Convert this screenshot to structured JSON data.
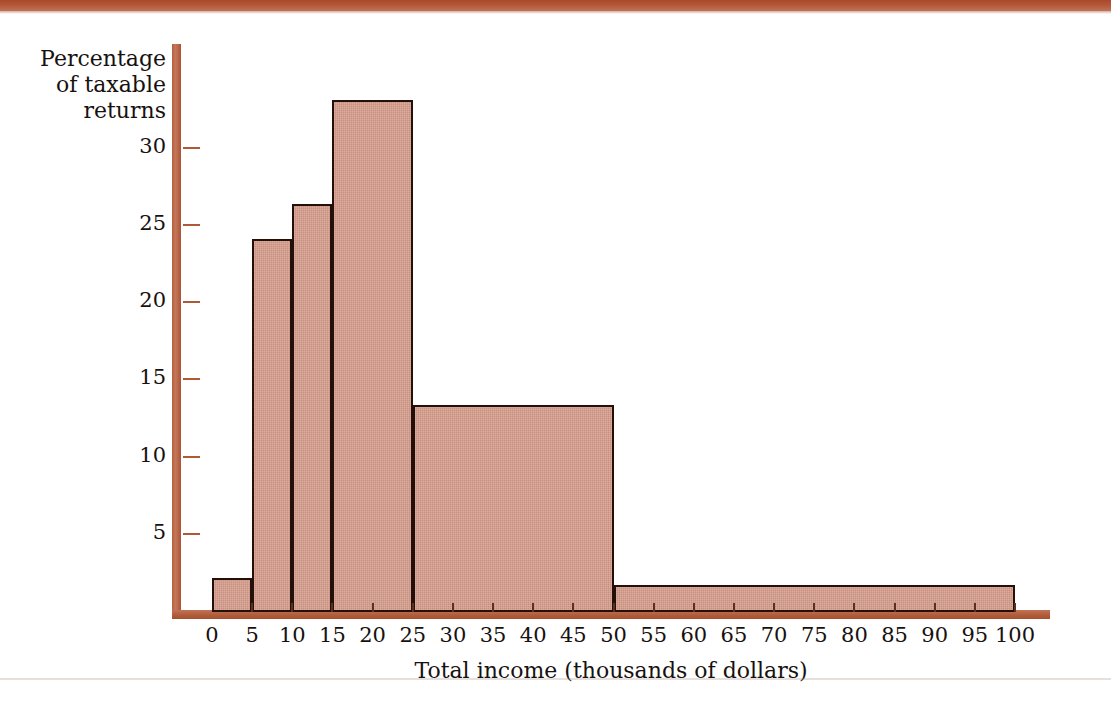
{
  "page": {
    "background_color": "#ffffff",
    "rule_color": "#b2573 8",
    "top_rule_color": "#b25738",
    "bottom_rule_color": "#b0968c"
  },
  "chart_data": {
    "type": "bar",
    "subtype": "histogram",
    "title": "",
    "xlabel": "Total income (thousands of dollars)",
    "ylabel": "Percentage\nof taxable\nreturns",
    "ylabel_lines": [
      "Percentage",
      "of taxable",
      "returns"
    ],
    "xlim": [
      0,
      105
    ],
    "ylim": [
      0,
      34
    ],
    "grid": false,
    "legend": null,
    "axis_color": "#b5603f",
    "bar_fill_color": "#cf9583",
    "bar_edge_color": "#241008",
    "text_color": "#17110f",
    "x_ticks": [
      0,
      5,
      10,
      15,
      20,
      25,
      30,
      35,
      40,
      45,
      50,
      55,
      60,
      65,
      70,
      75,
      80,
      85,
      90,
      95,
      100
    ],
    "x_tick_labels": [
      "0",
      "5",
      "10",
      "15",
      "20",
      "25",
      "30",
      "35",
      "40",
      "45",
      "50",
      "55",
      "60",
      "65",
      "70",
      "75",
      "80",
      "85",
      "90",
      "95",
      "100"
    ],
    "y_ticks": [
      5,
      10,
      15,
      20,
      25,
      30
    ],
    "y_tick_labels": [
      "5",
      "10",
      "15",
      "20",
      "25",
      "30"
    ],
    "bins": [
      {
        "label": "0–5",
        "x0": 0,
        "x1": 5,
        "value": 2.1
      },
      {
        "label": "5–10",
        "x0": 5,
        "x1": 10,
        "value": 24.0
      },
      {
        "label": "10–15",
        "x0": 10,
        "x1": 15,
        "value": 26.3
      },
      {
        "label": "15–25",
        "x0": 15,
        "x1": 25,
        "value": 33.0
      },
      {
        "label": "25–50",
        "x0": 25,
        "x1": 50,
        "value": 13.3
      },
      {
        "label": "50–100",
        "x0": 50,
        "x1": 100,
        "value": 1.6
      }
    ]
  }
}
